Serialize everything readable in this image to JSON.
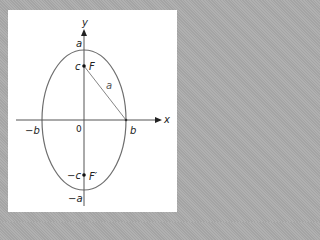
{
  "diagram": {
    "type": "ellipse-foci",
    "colors": {
      "background": "#a9a9a9",
      "panel": "#ffffff",
      "ellipse": "#6e6e6e",
      "axis": "#555555",
      "text": "#222222"
    },
    "axes": {
      "x_label": "x",
      "y_label": "y",
      "origin_label": "0"
    },
    "labels": {
      "top_vertex": "a",
      "bottom_vertex": "−a",
      "right_covertex": "b",
      "left_covertex": "−b",
      "focus_upper_coord": "c",
      "focus_upper_name": "F",
      "focus_lower_coord": "−c",
      "focus_lower_name": "F′",
      "segment_label": "a"
    }
  }
}
